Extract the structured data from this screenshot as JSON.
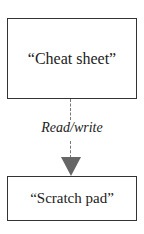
{
  "diagram": {
    "nodes": [
      {
        "id": "cheat-sheet",
        "label": "“Cheat sheet”"
      },
      {
        "id": "scratch-pad",
        "label": "“Scratch pad”"
      }
    ],
    "edges": [
      {
        "from": "cheat-sheet",
        "to": "scratch-pad",
        "label": "Read/write",
        "style": "dashed",
        "color": "#666666"
      }
    ]
  }
}
